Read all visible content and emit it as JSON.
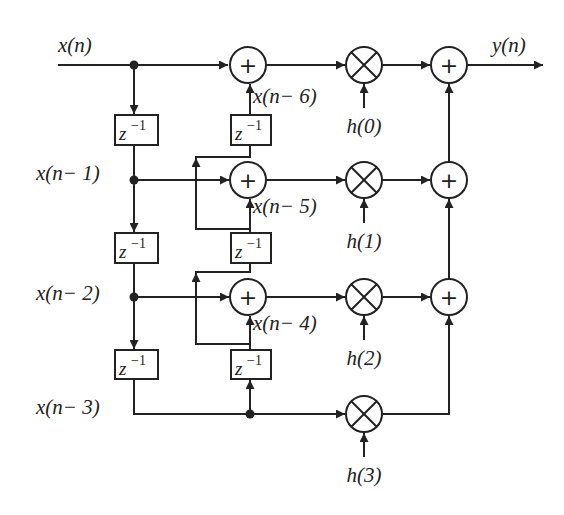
{
  "diagram": {
    "input_label": "x(n)",
    "output_label": "y(n)",
    "delay_label": {
      "base": "z",
      "exponent": "−1"
    },
    "left_taps": [
      {
        "label": "x(n− 1)"
      },
      {
        "label": "x(n− 2)"
      },
      {
        "label": "x(n− 3)"
      }
    ],
    "right_taps": [
      {
        "label": "x(n− 6)"
      },
      {
        "label": "x(n− 5)"
      },
      {
        "label": "x(n− 4)"
      }
    ],
    "coefficients": [
      {
        "label": "h(0)"
      },
      {
        "label": "h(1)"
      },
      {
        "label": "h(2)"
      },
      {
        "label": "h(3)"
      }
    ],
    "symbols": {
      "adder": "+",
      "multiplier": "×"
    },
    "colors": {
      "stroke": "#222222",
      "background": "#ffffff"
    }
  }
}
